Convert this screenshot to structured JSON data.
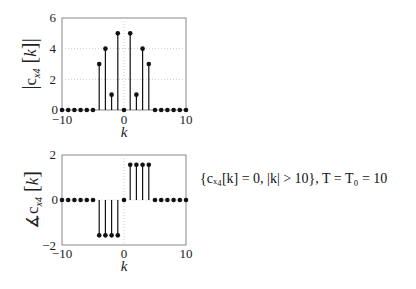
{
  "chart_data": [
    {
      "type": "stem",
      "title": "",
      "xlabel": "k",
      "ylabel": "|c_x4[k]|",
      "xlim": [
        -10,
        10
      ],
      "ylim": [
        0,
        6
      ],
      "xticks": [
        -10,
        0,
        10
      ],
      "yticks": [
        0,
        2,
        4,
        6
      ],
      "grid": true,
      "x": [
        -10,
        -9,
        -8,
        -7,
        -6,
        -5,
        -4,
        -3,
        -2,
        -1,
        0,
        1,
        2,
        3,
        4,
        5,
        6,
        7,
        8,
        9,
        10
      ],
      "values": [
        0,
        0,
        0,
        0,
        0,
        0,
        3,
        4,
        1,
        5,
        0,
        5,
        1,
        4,
        3,
        0,
        0,
        0,
        0,
        0,
        0
      ]
    },
    {
      "type": "stem",
      "title": "",
      "xlabel": "k",
      "ylabel": "∡c_x4[k]",
      "xlim": [
        -10,
        10
      ],
      "ylim": [
        -2,
        2
      ],
      "xticks": [
        -10,
        0,
        10
      ],
      "yticks": [
        -2,
        0,
        2
      ],
      "grid": true,
      "x": [
        -10,
        -9,
        -8,
        -7,
        -6,
        -5,
        -4,
        -3,
        -2,
        -1,
        0,
        1,
        2,
        3,
        4,
        5,
        6,
        7,
        8,
        9,
        10
      ],
      "values": [
        0,
        0,
        0,
        0,
        0,
        0,
        -1.57,
        -1.57,
        -1.57,
        -1.57,
        0,
        1.57,
        1.57,
        1.57,
        1.57,
        0,
        0,
        0,
        0,
        0,
        0
      ]
    }
  ],
  "labels": {
    "top_ylabel_main": "c",
    "top_ylabel_sub": "x4",
    "top_ylabel_arg": "k",
    "bottom_ylabel_prefix": "∡",
    "xlabel": "k",
    "tick_neg10": "−10",
    "tick_0": "0",
    "tick_10": "10",
    "ytick_top": [
      "0",
      "2",
      "4",
      "6"
    ],
    "ytick_bottom": [
      "−2",
      "0",
      "2"
    ]
  },
  "annotation": "{cₓ₄[k] = 0,  |k| > 10},    T = T₀ = 10"
}
